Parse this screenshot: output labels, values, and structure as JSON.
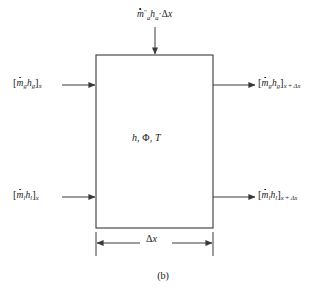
{
  "figure": {
    "caption": "(b)",
    "background_color": "#ffffff",
    "line_color": "#3a3a3a",
    "text_color": "#1a1a1a"
  },
  "control_volume": {
    "state_label": {
      "enthalpy": "h",
      "separator1": ", ",
      "porosity": "Φ",
      "separator2": ", ",
      "temperature": "T"
    }
  },
  "dimension": {
    "delta_symbol": "Δ",
    "axis_symbol": "x"
  },
  "flows": {
    "source_top": {
      "mdot_symbol": "m",
      "mdot_superscript": "′′",
      "mdot_subscript": "a",
      "enthalpy_symbol": "h",
      "enthalpy_subscript": "a",
      "operator": "·",
      "delta_symbol": "Δ",
      "axis_symbol": "x",
      "direction": "into-top"
    },
    "gas_in": {
      "open_bracket": "[",
      "mdot_symbol": "m",
      "mdot_subscript": "g",
      "enthalpy_symbol": "h",
      "enthalpy_subscript": "g",
      "close_bracket": "]",
      "position_subscript": "x",
      "direction": "into-left"
    },
    "gas_out": {
      "open_bracket": "[",
      "mdot_symbol": "m",
      "mdot_subscript": "g",
      "enthalpy_symbol": "h",
      "enthalpy_subscript": "g",
      "close_bracket": "]",
      "position_subscript_base": "x",
      "position_subscript_plus": " + ",
      "position_subscript_delta": "Δx",
      "direction": "out-right"
    },
    "liquid_in": {
      "open_bracket": "[",
      "mdot_symbol": "m",
      "mdot_subscript": "l",
      "enthalpy_symbol": "h",
      "enthalpy_subscript": "l",
      "close_bracket": "]",
      "position_subscript": "x",
      "direction": "into-left"
    },
    "liquid_out": {
      "open_bracket": "[",
      "mdot_symbol": "m",
      "mdot_subscript": "l",
      "enthalpy_symbol": "h",
      "enthalpy_subscript": "l",
      "close_bracket": "]",
      "position_subscript_base": "x",
      "position_subscript_plus": " + ",
      "position_subscript_delta": "Δx",
      "direction": "out-right"
    }
  }
}
